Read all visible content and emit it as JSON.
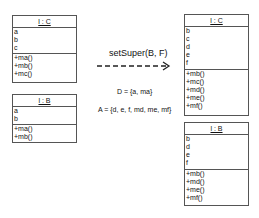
{
  "left": {
    "class_c": {
      "title": "l : C",
      "attributes": [
        "a",
        "b",
        "c"
      ],
      "operations": [
        "+ma()",
        "+mb()",
        "+mc()"
      ]
    },
    "class_b": {
      "title": "l : B",
      "attributes": [
        "a",
        "b"
      ],
      "operations": [
        "+ma()",
        "+mb()"
      ]
    }
  },
  "transform": {
    "operation": "setSuper(B, F)",
    "d_set": "D = {a, ma}",
    "a_set": "A = {d, e, f, md, me, mf}"
  },
  "right": {
    "class_c": {
      "title": "l : C",
      "attributes": [
        "b",
        "c",
        "d",
        "e",
        "f"
      ],
      "operations": [
        "+mb()",
        "+mc()",
        "+md()",
        "+me()",
        "+mf()"
      ]
    },
    "class_b": {
      "title": "l : B",
      "attributes": [
        "b",
        "d",
        "e",
        "f"
      ],
      "operations": [
        "+mb()",
        "+md()",
        "+me()",
        "+mf()"
      ]
    }
  }
}
